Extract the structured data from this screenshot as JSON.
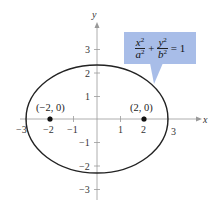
{
  "figure": {
    "type": "ellipse-graph",
    "axes": {
      "x_label": "x",
      "y_label": "y",
      "x_ticks": [
        "−3",
        "−2",
        "−1",
        "1",
        "2",
        "3"
      ],
      "y_ticks": [
        "3",
        "2",
        "1",
        "−1",
        "−2",
        "−3"
      ]
    },
    "ellipse": {
      "center": [
        0,
        0
      ],
      "semi_major_x": 2.9,
      "semi_minor_y": 2.3
    },
    "points": [
      {
        "label": "(−2, 0)",
        "x": -2,
        "y": 0
      },
      {
        "label": "(2, 0)",
        "x": 2,
        "y": 0
      }
    ],
    "callout": {
      "term1_num": "x",
      "term1_den": "a",
      "term2_num": "y",
      "term2_den": "b",
      "exp": "2",
      "plus": "+",
      "equals": "= 1",
      "color": "#a8bde8"
    }
  }
}
